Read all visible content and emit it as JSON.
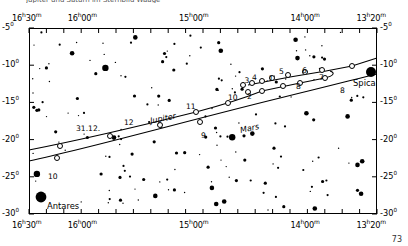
{
  "page": {
    "cut_off_title": "Jupiter und Saturn im Sternbild Waage",
    "page_number": "73"
  },
  "chart_data": {
    "type": "scatter",
    "title": "",
    "xlabel": "Right Ascension",
    "ylabel": "Declination",
    "grid": false,
    "legend": "none",
    "x_axis": {
      "unit": "hours-minutes",
      "direction": "right-to-left",
      "range_left": "16h30m",
      "range_right": "13h20m",
      "tick_labels": [
        "16h30m",
        "16h00m",
        "15h00m",
        "14h00m",
        "13h20m"
      ],
      "tick_labels_top": [
        "16h30m",
        "16h00m",
        "15h00m",
        "14h00m",
        "13h20m"
      ],
      "tick_labels_bottom": [
        "16h30m",
        "16h00m",
        "15h00m",
        "14h00m",
        "13h20m"
      ],
      "minor_tick_count": 20
    },
    "y_axis": {
      "unit": "degrees",
      "range": [
        -30,
        -5
      ],
      "tick_labels_left": [
        "-5°",
        "-10°",
        "-15°",
        "-20°",
        "-25°",
        "-30°"
      ],
      "tick_labels_right": [
        "-5°",
        "-10°",
        "-15°",
        "-20°",
        "-25°",
        "-30°"
      ]
    },
    "named_stars": [
      {
        "name": "Antares",
        "x_px": 41,
        "y_px": 197,
        "magnitude_px": 5.4
      },
      {
        "name": "Spica",
        "x_px": 371,
        "y_px": 72,
        "magnitude_px": 5.0
      }
    ],
    "tracks": [
      {
        "name": "Jupiter",
        "label": "Jupiter",
        "label_x": 150,
        "label_y": 114
      },
      {
        "name": "Mars",
        "label": "Mars",
        "label_x": 240,
        "label_y": 124
      }
    ],
    "jupiter_markers": [
      {
        "label": "31.12.",
        "lx": 76,
        "ly": 124
      },
      {
        "label": "12",
        "lx": 124,
        "ly": 118
      },
      {
        "label": "11",
        "lx": 186,
        "ly": 102
      },
      {
        "label": "10",
        "lx": 228,
        "ly": 93
      },
      {
        "label": ".3",
        "lx": 242,
        "ly": 76
      },
      {
        "label": "4",
        "lx": 252,
        "ly": 73
      },
      {
        "label": ".1",
        "lx": 266,
        "ly": 74
      },
      {
        "label": "5",
        "lx": 279,
        "ly": 67
      },
      {
        "label": "6",
        "lx": 302,
        "ly": 66
      },
      {
        "label": "7",
        "lx": 319,
        "ly": 73
      },
      {
        "label": "8",
        "lx": 296,
        "ly": 82
      },
      {
        "label": "2",
        "lx": 247,
        "ly": 92
      }
    ],
    "mars_markers": [
      {
        "label": "10",
        "lx": 48,
        "ly": 172
      },
      {
        "label": "9",
        "lx": 201,
        "ly": 131
      },
      {
        "label": "8",
        "lx": 340,
        "ly": 86
      }
    ],
    "star_count": 178
  }
}
